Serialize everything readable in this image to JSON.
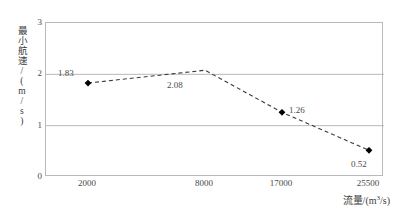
{
  "chart_data": {
    "type": "line",
    "title": "",
    "xlabel": "流量/(m³/s)",
    "ylabel": "最小航速/(m/s)",
    "categories": [
      "2000",
      "8000",
      "17000",
      "25500"
    ],
    "values": [
      1.83,
      2.08,
      1.26,
      0.52
    ],
    "point_labels": [
      "1.83",
      "2.08",
      "1.26",
      "0.52"
    ],
    "series": [
      {
        "name": "最小航速",
        "values": [
          1.83,
          2.08,
          1.26,
          0.52
        ],
        "line_style": "dashed",
        "line_color": "#3a3a3a",
        "marker": "diamond",
        "marker_color": "#000000"
      }
    ],
    "ylim": [
      0,
      3
    ],
    "yticks": [
      "0",
      "1",
      "2",
      "3"
    ],
    "grid": "horizontal",
    "grid_color": "#b9b9b9",
    "legend": "none",
    "axis_box": true,
    "background": "#ffffff"
  },
  "axes": {
    "y_title": "最小航速/(m/s)",
    "x_title_main": "流量/(m",
    "x_title_sup": "3",
    "x_title_tail": "/s)"
  }
}
